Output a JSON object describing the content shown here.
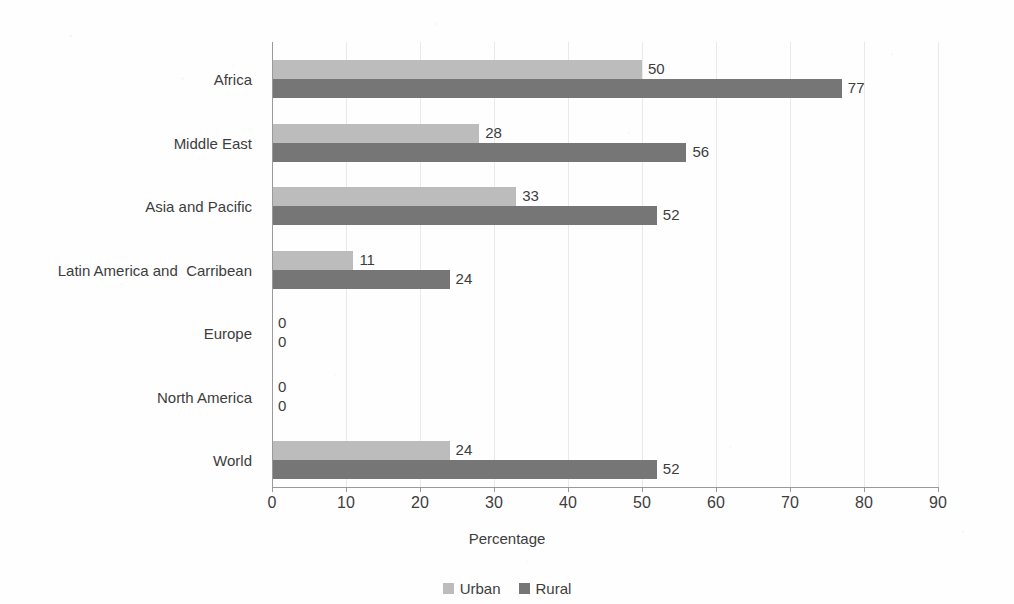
{
  "chart_data": {
    "type": "bar",
    "orientation": "horizontal",
    "title": "",
    "xlabel": "Percentage",
    "ylabel": "",
    "xlim": [
      0,
      90
    ],
    "xticks": [
      0,
      10,
      20,
      30,
      40,
      50,
      60,
      70,
      80,
      90
    ],
    "grid": true,
    "grid_axis": "x",
    "legend_position": "bottom",
    "categories": [
      "Africa",
      "Middle East",
      "Asia and Pacific",
      "Latin America and  Carribean",
      "Europe",
      "North America",
      "World"
    ],
    "series": [
      {
        "name": "Urban",
        "color": "#bcbcbc",
        "values": [
          50,
          28,
          33,
          11,
          0,
          0,
          24
        ]
      },
      {
        "name": "Rural",
        "color": "#767676",
        "values": [
          77,
          56,
          52,
          24,
          0,
          0,
          52
        ]
      }
    ],
    "data_labels": [
      {
        "category": "Africa",
        "urban": "50",
        "rural": "77"
      },
      {
        "category": "Middle East",
        "urban": "28",
        "rural": "56"
      },
      {
        "category": "Asia and Pacific",
        "urban": "33",
        "rural": "52"
      },
      {
        "category": "Latin America and  Carribean",
        "urban": "11",
        "rural": "24"
      },
      {
        "category": "Europe",
        "urban": "0",
        "rural": "0"
      },
      {
        "category": "North America",
        "urban": "0",
        "rural": "0"
      },
      {
        "category": "World",
        "urban": "24",
        "rural": "52"
      }
    ]
  },
  "axis": {
    "x_title": "Percentage",
    "tick_labels": [
      "0",
      "10",
      "20",
      "30",
      "40",
      "50",
      "60",
      "70",
      "80",
      "90"
    ]
  },
  "legend": {
    "items": [
      {
        "label": "Urban",
        "color": "#bcbcbc"
      },
      {
        "label": "Rural",
        "color": "#767676"
      }
    ]
  },
  "colors": {
    "urban": "#bcbcbc",
    "rural": "#767676",
    "axis": "#9a9a9a",
    "grid": "#e9e9ec",
    "text": "#3d3d3d",
    "background": "#fefefe"
  }
}
